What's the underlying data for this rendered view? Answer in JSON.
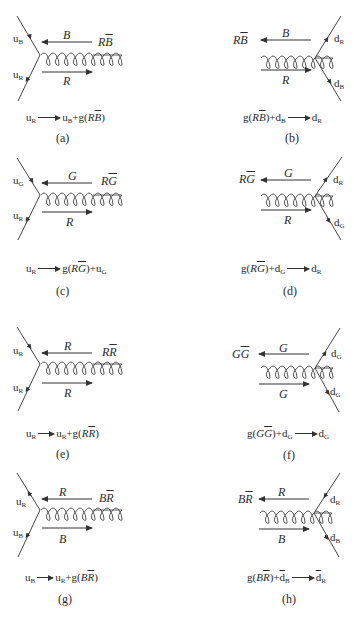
{
  "figure": {
    "panels": [
      {
        "id": "a",
        "side": "left",
        "quark_top": {
          "base": "u",
          "color": "B"
        },
        "quark_bottom": {
          "base": "u",
          "color": "R"
        },
        "gluon_label": {
          "main": "R",
          "bar": "B"
        },
        "top_arrow_label": "B",
        "bottom_arrow_label": "R",
        "equation": {
          "lhs": "u",
          "lhs_sub": "R",
          "rhs_parts": [
            "u",
            "B",
            "+g(",
            "R",
            "B",
            ")"
          ]
        },
        "caption": "(a)"
      },
      {
        "id": "b",
        "side": "right",
        "quark_top": {
          "base": "d",
          "color": "R"
        },
        "quark_bottom": {
          "base": "d",
          "color": "B"
        },
        "gluon_label": {
          "main": "R",
          "bar": "B"
        },
        "top_arrow_label": "B",
        "bottom_arrow_label": "R",
        "equation": {
          "text": "g(RB̄)+dB → dR"
        },
        "caption": "(b)"
      },
      {
        "id": "c",
        "side": "left",
        "quark_top": {
          "base": "u",
          "color": "G"
        },
        "quark_bottom": {
          "base": "u",
          "color": "R"
        },
        "gluon_label": {
          "main": "R",
          "bar": "G"
        },
        "top_arrow_label": "G",
        "bottom_arrow_label": "R",
        "equation": {
          "text": "uR → g(RḠ)+uG"
        },
        "caption": "(c)"
      },
      {
        "id": "d",
        "side": "right",
        "quark_top": {
          "base": "d",
          "color": "R"
        },
        "quark_bottom": {
          "base": "d",
          "color": "G"
        },
        "gluon_label": {
          "main": "R",
          "bar": "G"
        },
        "top_arrow_label": "G",
        "bottom_arrow_label": "R",
        "equation": {
          "text": "g(RḠ)+dG → dR"
        },
        "caption": "(d)"
      },
      {
        "id": "e",
        "side": "left",
        "quark_top": {
          "base": "u",
          "color": "R"
        },
        "quark_bottom": {
          "base": "u",
          "color": "R"
        },
        "gluon_label": {
          "main": "R",
          "bar": "R"
        },
        "top_arrow_label": "R",
        "bottom_arrow_label": "R",
        "equation": {
          "text": "uR → uR+g(RR̄)"
        },
        "caption": "(e)"
      },
      {
        "id": "f",
        "side": "right",
        "quark_top": {
          "base": "d",
          "color": "G"
        },
        "quark_bottom": {
          "base": "d",
          "color": "G"
        },
        "gluon_label": {
          "main": "G",
          "bar": "G"
        },
        "top_arrow_label": "G",
        "bottom_arrow_label": "G",
        "equation": {
          "text": "g(GḠ)+dG → dG"
        },
        "caption": "(f)"
      },
      {
        "id": "g",
        "side": "left",
        "quark_top": {
          "base": "u",
          "color": "R"
        },
        "quark_bottom": {
          "base": "u",
          "color": "B"
        },
        "gluon_label": {
          "main": "B",
          "bar": "R"
        },
        "top_arrow_label": "R",
        "bottom_arrow_label": "B",
        "equation": {
          "text": "uB → uR+g(BR̄)"
        },
        "caption": "(g)"
      },
      {
        "id": "h",
        "side": "right",
        "quark_top": {
          "base": "d",
          "color": "R"
        },
        "quark_bottom": {
          "base": "d",
          "color": "B"
        },
        "gluon_label": {
          "main": "B",
          "bar": "R"
        },
        "top_arrow_label": "R",
        "bottom_arrow_label": "B",
        "equation": {
          "text": "g(BR̄)+d̄B → d̄R"
        },
        "caption": "(h)"
      }
    ]
  },
  "labels": {
    "a": {
      "q_top": "u",
      "q_top_sub": "B",
      "q_bot": "u",
      "q_bot_sub": "R",
      "g_main": "R",
      "g_bar": "B",
      "arr_top": "B",
      "arr_bot": "R",
      "eq_l": "u",
      "eq_l_sub": "R",
      "eq_r1": "u",
      "eq_r1_sub": "B",
      "eq_r2": "+g(",
      "eq_g_main": "R",
      "eq_g_bar": "B",
      "eq_close": ")",
      "cap": "(a)"
    },
    "b": {
      "q_top": "d",
      "q_top_sub": "R",
      "q_bot": "d",
      "q_bot_sub": "B",
      "g_main": "R",
      "g_bar": "B",
      "arr_top": "B",
      "arr_bot": "R",
      "eq_pre": "g(",
      "eq_g_main": "R",
      "eq_g_bar": "B",
      "eq_close": ")+d",
      "eq_l_sub": "B",
      "eq_r": "d",
      "eq_r_sub": "R",
      "cap": "(b)"
    },
    "c": {
      "q_top": "u",
      "q_top_sub": "G",
      "q_bot": "u",
      "q_bot_sub": "R",
      "g_main": "R",
      "g_bar": "G",
      "arr_top": "G",
      "arr_bot": "R",
      "eq_l": "u",
      "eq_l_sub": "R",
      "eq_r2": "g(",
      "eq_g_main": "R",
      "eq_g_bar": "G",
      "eq_close": ")+u",
      "eq_close_sub": "G",
      "cap": "(c)"
    },
    "d": {
      "q_top": "d",
      "q_top_sub": "R",
      "q_bot": "d",
      "q_bot_sub": "G",
      "g_main": "R",
      "g_bar": "G",
      "arr_top": "G",
      "arr_bot": "R",
      "eq_pre": "g(",
      "eq_g_main": "R",
      "eq_g_bar": "G",
      "eq_close": ")+d",
      "eq_l_sub": "G",
      "eq_r": "d",
      "eq_r_sub": "R",
      "cap": "(d)"
    },
    "e": {
      "q_top": "u",
      "q_top_sub": "R",
      "q_bot": "u",
      "q_bot_sub": "R",
      "g_main": "R",
      "g_bar": "R",
      "arr_top": "R",
      "arr_bot": "R",
      "eq_l": "u",
      "eq_l_sub": "R",
      "eq_r1": "u",
      "eq_r1_sub": "R",
      "eq_r2": "+g(",
      "eq_g_main": "R",
      "eq_g_bar": "R",
      "eq_close": ")",
      "cap": "(e)"
    },
    "f": {
      "q_top": "d",
      "q_top_sub": "G",
      "q_bot": "d",
      "q_bot_sub": "G",
      "g_main": "G",
      "g_bar": "G",
      "arr_top": "G",
      "arr_bot": "G",
      "eq_pre": "g(",
      "eq_g_main": "G",
      "eq_g_bar": "G",
      "eq_close": ")+d",
      "eq_l_sub": "G",
      "eq_r": "d",
      "eq_r_sub": "G",
      "cap": "(f)"
    },
    "g": {
      "q_top": "u",
      "q_top_sub": "R",
      "q_bot": "u",
      "q_bot_sub": "B",
      "g_main": "B",
      "g_bar": "R",
      "arr_top": "R",
      "arr_bot": "B",
      "eq_l": "u",
      "eq_l_sub": "B",
      "eq_r1": "u",
      "eq_r1_sub": "R",
      "eq_r2": "+g(",
      "eq_g_main": "B",
      "eq_g_bar": "R",
      "eq_close": ")",
      "cap": "(g)"
    },
    "h": {
      "q_top": "d",
      "q_top_sub": "R",
      "q_bot": "d",
      "q_bot_sub": "B",
      "g_main": "B",
      "g_bar": "R",
      "arr_top": "R",
      "arr_bot": "B",
      "eq_pre": "g(",
      "eq_g_main": "B",
      "eq_g_bar": "R",
      "eq_close": ")+",
      "eq_dbar": "d",
      "eq_l_sub": "B",
      "eq_r": "d",
      "eq_r_sub": "R",
      "cap": "(h)"
    }
  }
}
